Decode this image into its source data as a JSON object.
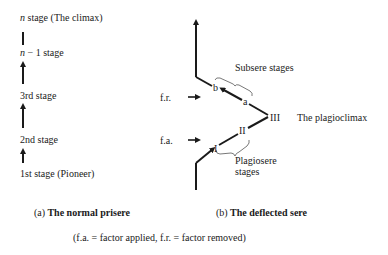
{
  "left_diagram": {
    "stages": [
      {
        "prefix": "n",
        "label": " stage (The climax)"
      },
      {
        "prefix": "n",
        "label": " − 1 stage"
      },
      {
        "prefix": "",
        "label": "3rd stage"
      },
      {
        "prefix": "",
        "label": "2nd stage"
      },
      {
        "prefix": "",
        "label": "1st stage (Pioneer)"
      }
    ],
    "caption_prefix": "(a)",
    "caption": "The normal prisere"
  },
  "right_diagram": {
    "factor_removed_label": "f.r.",
    "factor_applied_label": "f.a.",
    "subsere_label": "Subsere stages",
    "plagiosere_label_line1": "Plagiosere",
    "plagiosere_label_line2": "stages",
    "plagioclimax_label": "The plagioclimax",
    "nodes": {
      "I": "I",
      "II": "II",
      "III": "III",
      "a": "a",
      "b": "b"
    },
    "caption_prefix": "(b)",
    "caption": "The deflected sere"
  },
  "footnote": "(f.a. = factor applied, f.r. = factor removed)",
  "colors": {
    "ink": "#1a1a1a",
    "background": "#ffffff"
  }
}
